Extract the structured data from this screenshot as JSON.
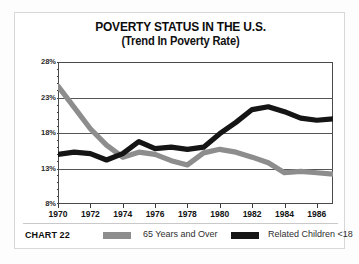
{
  "chart_data": {
    "type": "line",
    "title": "POVERTY STATUS IN THE U.S.",
    "subtitle": "(Trend In Poverty Rate)",
    "xlabel": "",
    "ylabel": "",
    "ylim": [
      8,
      28
    ],
    "xlim": [
      1970,
      1987
    ],
    "ytick_labels": [
      "28%",
      "23%",
      "18%",
      "13%",
      "8%"
    ],
    "ytick_values": [
      28,
      23,
      18,
      13,
      8
    ],
    "xtick_labels": [
      "1970",
      "1972",
      "1974",
      "1976",
      "1978",
      "1980",
      "1982",
      "1984",
      "1986"
    ],
    "xtick_values": [
      1970,
      1972,
      1974,
      1976,
      1978,
      1980,
      1982,
      1984,
      1986
    ],
    "grid": true,
    "legend_position": "bottom",
    "x": [
      1970,
      1971,
      1972,
      1973,
      1974,
      1975,
      1976,
      1977,
      1978,
      1979,
      1980,
      1981,
      1982,
      1983,
      1984,
      1985,
      1986,
      1987
    ],
    "series": [
      {
        "name": "65 Years and Over",
        "color": "#8d8d8d",
        "values": [
          24.6,
          21.6,
          18.6,
          16.3,
          14.6,
          15.3,
          15.0,
          14.1,
          13.5,
          15.2,
          15.7,
          15.3,
          14.6,
          13.8,
          12.4,
          12.6,
          12.4,
          12.2
        ]
      },
      {
        "name": "Related Children <18",
        "color": "#151515",
        "values": [
          15.0,
          15.3,
          15.1,
          14.2,
          15.1,
          16.8,
          15.8,
          16.0,
          15.7,
          16.0,
          17.9,
          19.5,
          21.3,
          21.7,
          21.0,
          20.1,
          19.8,
          20.0
        ]
      }
    ]
  },
  "footer": {
    "chart_number": "CHART 22",
    "legend": [
      {
        "label": "65 Years and Over",
        "color": "#8d8d8d"
      },
      {
        "label": "Related Children <18",
        "color": "#151515"
      }
    ]
  }
}
